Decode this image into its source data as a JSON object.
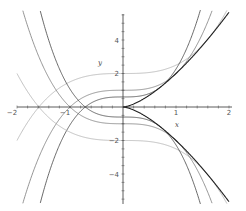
{
  "chart_data": {
    "type": "line",
    "title": "",
    "xlabel": "x",
    "ylabel": "y",
    "xlim": [
      -2,
      2
    ],
    "ylim": [
      -5.8,
      5.8
    ],
    "grid": false,
    "legend": null,
    "x_ticks": [
      -2,
      -1,
      1,
      2
    ],
    "x_tick_labels": [
      "−2",
      "−1",
      "1",
      "2"
    ],
    "y_ticks": [
      -4,
      -2,
      2,
      4
    ],
    "y_tick_labels": [
      "−4",
      "−2",
      "2",
      "4"
    ],
    "series": [
      {
        "name": "y = 2 + x^3/2",
        "a": 2,
        "sign": 1,
        "color": "#b0b0b0"
      },
      {
        "name": "y = 1 + x^3",
        "a": 1,
        "sign": 1,
        "color": "#7a7a7a"
      },
      {
        "name": "y = 0.6 + x^3/0.6",
        "a": 0.6,
        "sign": 1,
        "color": "#444444"
      },
      {
        "name": "y = -(2 + x^3/2)",
        "a": 2,
        "sign": -1,
        "color": "#b0b0b0"
      },
      {
        "name": "y = -(1 + x^3)",
        "a": 1,
        "sign": -1,
        "color": "#7a7a7a"
      },
      {
        "name": "y = -(0.6 + x^3/0.6)",
        "a": 0.6,
        "sign": -1,
        "color": "#444444"
      },
      {
        "name": "envelope y = 2x^(3/2)",
        "envelope": true,
        "sign": 1,
        "color": "#222222"
      },
      {
        "name": "envelope y = -2x^(3/2)",
        "envelope": true,
        "sign": -1,
        "color": "#222222"
      }
    ],
    "sample_points": {
      "y = 2 + x^3/2": {
        "x": [
          -2,
          -1,
          0,
          1,
          2
        ],
        "y": [
          -2,
          1.5,
          2,
          2.5,
          6
        ]
      },
      "y = 1 + x^3": {
        "x": [
          -1.5,
          -1,
          0,
          1,
          1.6
        ],
        "y": [
          -2.375,
          0,
          1,
          2,
          5.1
        ]
      },
      "envelope y = 2x^(3/2)": {
        "x": [
          0,
          1,
          2
        ],
        "y": [
          0,
          2,
          5.66
        ]
      }
    }
  },
  "axes": {
    "x_label": "x",
    "y_label": "y"
  }
}
